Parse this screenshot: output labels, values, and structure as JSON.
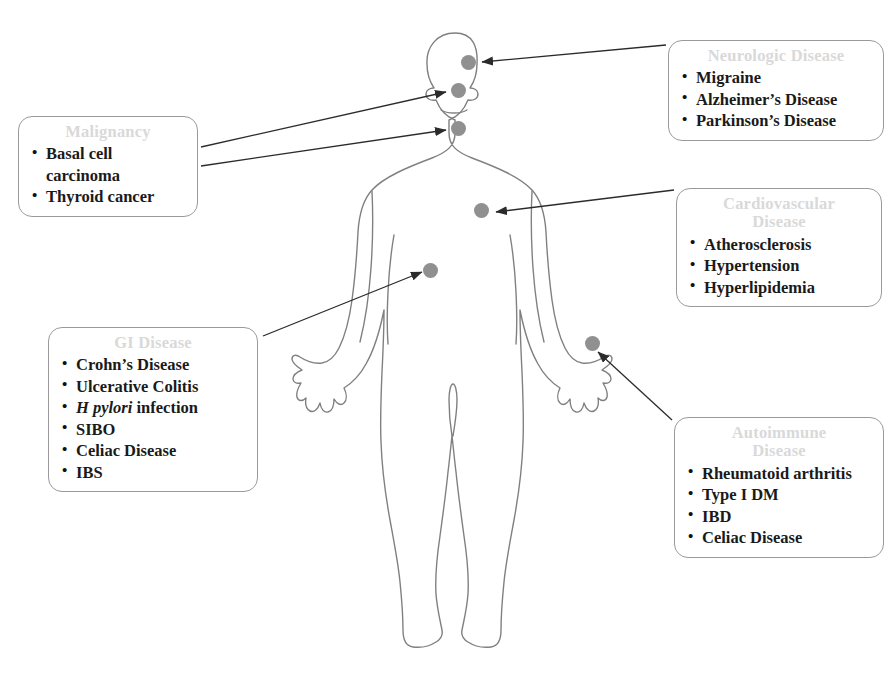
{
  "diagram": {
    "background_color": "#ffffff",
    "figure_outline_color": "#808080",
    "marker_color": "#909090",
    "arrow_color": "#2b2b2b",
    "box_border_color": "#9a9a9a",
    "box_title_color": "#d9d9d9",
    "box_text_color": "#1a1a1a"
  },
  "callouts": [
    {
      "id": "malignancy",
      "title": "Malignancy",
      "items": [
        "Basal cell carcinoma",
        "Thyroid cancer"
      ],
      "target_sites": [
        "face",
        "neck-thyroid"
      ]
    },
    {
      "id": "gi-disease",
      "title": "GI Disease",
      "items": [
        "Crohn’s Disease",
        "Ulcerative Colitis",
        "H pylori infection",
        "SIBO",
        "Celiac Disease",
        "IBS"
      ],
      "italic_items": {
        "H pylori infection": "H pylori"
      },
      "target_sites": [
        "abdomen"
      ]
    },
    {
      "id": "neurologic-disease",
      "title": "Neurologic Disease",
      "items": [
        "Migraine",
        "Alzheimer’s Disease",
        "Parkinson’s Disease"
      ],
      "target_sites": [
        "brain"
      ]
    },
    {
      "id": "cardiovascular-disease",
      "title": "Cardiovascular\nDisease",
      "items": [
        "Atherosclerosis",
        "Hypertension",
        "Hyperlipidemia"
      ],
      "target_sites": [
        "heart"
      ]
    },
    {
      "id": "autoimmune-disease",
      "title": "Autoimmune\nDisease",
      "items": [
        "Rheumatoid arthritis",
        "Type I DM",
        "IBD",
        "Celiac Disease"
      ],
      "target_sites": [
        "wrist-hand"
      ]
    }
  ],
  "markers": [
    {
      "id": "brain",
      "label": "brain-marker",
      "x": 468,
      "y": 62
    },
    {
      "id": "face",
      "label": "face-marker",
      "x": 458,
      "y": 90
    },
    {
      "id": "neck-thyroid",
      "label": "neck-thyroid-marker",
      "x": 458,
      "y": 128
    },
    {
      "id": "heart",
      "label": "heart-marker",
      "x": 481,
      "y": 210
    },
    {
      "id": "abdomen",
      "label": "abdomen-marker",
      "x": 430,
      "y": 270
    },
    {
      "id": "wrist-hand",
      "label": "wrist-hand-marker",
      "x": 592,
      "y": 343
    }
  ]
}
